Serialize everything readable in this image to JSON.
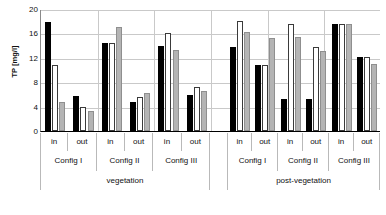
{
  "chart_data": {
    "type": "bar",
    "title": "",
    "xlabel": "",
    "ylabel": "TP [mg/l]",
    "ylim": [
      0,
      20
    ],
    "yticks": [
      0,
      4,
      8,
      12,
      16,
      20
    ],
    "ytick_labels": [
      "0",
      "4",
      "8",
      "12",
      "16",
      "20"
    ],
    "grid": true,
    "grid_axis": "y",
    "legend": "none",
    "series_colors": [
      "#000000",
      "#ffffff",
      "#b4b4b4"
    ],
    "series": [
      {
        "name": "series-1-black",
        "color": "#000000",
        "values": [
          17.8,
          5.7,
          14.5,
          4.7,
          13.9,
          5.9,
          13.7,
          10.8,
          5.3,
          5.2,
          17.6,
          12.2
        ]
      },
      {
        "name": "series-2-white",
        "color": "#ffffff",
        "values": [
          10.9,
          3.9,
          14.5,
          5.6,
          16.0,
          7.2,
          18.0,
          10.9,
          17.6,
          13.8,
          17.5,
          12.1
        ]
      },
      {
        "name": "series-3-grey",
        "color": "#b4b4b4",
        "values": [
          4.8,
          3.3,
          17.1,
          6.2,
          13.2,
          6.6,
          16.2,
          15.2,
          15.4,
          13.1,
          17.5,
          11.0
        ]
      }
    ],
    "categories": [
      "vegetation / Config I / in",
      "vegetation / Config I / out",
      "vegetation / Config II / in",
      "vegetation / Config II / out",
      "vegetation / Config III / in",
      "vegetation / Config III / out",
      "post-vegetation / Config I / in",
      "post-vegetation / Config I / out",
      "post-vegetation / Config II / in",
      "post-vegetation / Config II / out",
      "post-vegetation / Config III / in",
      "post-vegetation / Config III / out"
    ],
    "axis_tiers": {
      "inout": [
        "in",
        "out",
        "in",
        "out",
        "in",
        "out",
        "in",
        "out",
        "in",
        "out",
        "in",
        "out"
      ],
      "config": [
        "Config I",
        "Config II",
        "Config III",
        "Config I",
        "Config II",
        "Config III"
      ],
      "phase": [
        "vegetation",
        "post-vegetation"
      ]
    }
  }
}
